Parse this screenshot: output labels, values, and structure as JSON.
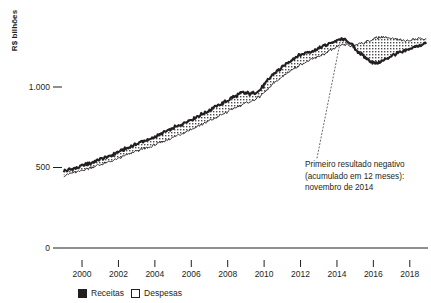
{
  "axes": {
    "ylabel": "R$ bilhões",
    "yticks": [
      {
        "label": "1.000",
        "value": 1000
      },
      {
        "label": "500",
        "value": 500
      },
      {
        "label": "0",
        "value": 0
      }
    ],
    "xticks": [
      {
        "label": "2000",
        "value": 2000
      },
      {
        "label": "2002",
        "value": 2002
      },
      {
        "label": "2004",
        "value": 2004
      },
      {
        "label": "2006",
        "value": 2006
      },
      {
        "label": "2008",
        "value": 2008
      },
      {
        "label": "2010",
        "value": 2010
      },
      {
        "label": "2012",
        "value": 2012
      },
      {
        "label": "2014",
        "value": 2014
      },
      {
        "label": "2016",
        "value": 2016
      },
      {
        "label": "2018",
        "value": 2018
      }
    ]
  },
  "annotation": {
    "line1": "Primeiro resultado negativo",
    "line2": "(acumulado em 12 meses):",
    "line3": "novembro de 2014"
  },
  "legend": {
    "items": [
      {
        "label": "Receitas",
        "swatch": "filled",
        "color": "#231f20"
      },
      {
        "label": "Despesas",
        "swatch": "hollow",
        "color": "#ffffff"
      }
    ]
  },
  "chart_data": {
    "type": "area",
    "title": "",
    "subtitle": "",
    "xlabel": "",
    "ylabel": "R$ bilhões",
    "xlim": [
      1998.9,
      2019.0
    ],
    "ylim": [
      0,
      1450
    ],
    "grid": false,
    "legend_position": "bottom-left",
    "annotations": [
      {
        "text": "Primeiro resultado negativo (acumulado em 12 meses): novembro de 2014",
        "target_x": 2014.85,
        "target_y": 1258,
        "style": "dotted-leader"
      }
    ],
    "x": [
      1999.0,
      1999.25,
      1999.5,
      1999.75,
      2000.0,
      2000.25,
      2000.5,
      2000.75,
      2001.0,
      2001.25,
      2001.5,
      2001.75,
      2002.0,
      2002.25,
      2002.5,
      2002.75,
      2003.0,
      2003.25,
      2003.5,
      2003.75,
      2004.0,
      2004.25,
      2004.5,
      2004.75,
      2005.0,
      2005.25,
      2005.5,
      2005.75,
      2006.0,
      2006.25,
      2006.5,
      2006.75,
      2007.0,
      2007.25,
      2007.5,
      2007.75,
      2008.0,
      2008.25,
      2008.5,
      2008.75,
      2009.0,
      2009.25,
      2009.5,
      2009.75,
      2010.0,
      2010.25,
      2010.5,
      2010.75,
      2011.0,
      2011.25,
      2011.5,
      2011.75,
      2012.0,
      2012.25,
      2012.5,
      2012.75,
      2013.0,
      2013.25,
      2013.5,
      2013.75,
      2014.0,
      2014.25,
      2014.5,
      2014.85,
      2015.0,
      2015.25,
      2015.5,
      2015.75,
      2016.0,
      2016.25,
      2016.5,
      2016.75,
      2017.0,
      2017.25,
      2017.5,
      2017.75,
      2018.0,
      2018.3,
      2018.6,
      2018.9
    ],
    "series": [
      {
        "name": "Receitas",
        "swatch": "filled",
        "values": [
          478,
          486,
          492,
          500,
          510,
          520,
          528,
          540,
          552,
          560,
          570,
          584,
          596,
          610,
          620,
          634,
          648,
          660,
          668,
          676,
          690,
          704,
          716,
          730,
          744,
          758,
          770,
          786,
          798,
          812,
          826,
          840,
          856,
          872,
          886,
          900,
          916,
          934,
          948,
          962,
          962,
          958,
          966,
          980,
          1012,
          1048,
          1078,
          1100,
          1122,
          1148,
          1168,
          1186,
          1200,
          1212,
          1220,
          1228,
          1240,
          1254,
          1266,
          1278,
          1288,
          1296,
          1292,
          1258,
          1236,
          1212,
          1186,
          1168,
          1152,
          1150,
          1162,
          1178,
          1196,
          1208,
          1214,
          1222,
          1236,
          1250,
          1262,
          1268
        ]
      },
      {
        "name": "Despesas",
        "swatch": "hollow",
        "values": [
          452,
          458,
          464,
          472,
          480,
          490,
          498,
          508,
          518,
          526,
          534,
          546,
          556,
          568,
          578,
          590,
          602,
          612,
          620,
          628,
          640,
          652,
          664,
          676,
          688,
          700,
          712,
          726,
          738,
          750,
          762,
          776,
          790,
          804,
          818,
          832,
          846,
          862,
          876,
          890,
          900,
          908,
          922,
          940,
          964,
          992,
          1018,
          1042,
          1062,
          1086,
          1104,
          1122,
          1138,
          1152,
          1164,
          1176,
          1190,
          1204,
          1218,
          1232,
          1246,
          1258,
          1262,
          1258,
          1264,
          1272,
          1276,
          1286,
          1300,
          1306,
          1312,
          1308,
          1302,
          1296,
          1292,
          1288,
          1292,
          1298,
          1302,
          1300
        ]
      }
    ]
  }
}
